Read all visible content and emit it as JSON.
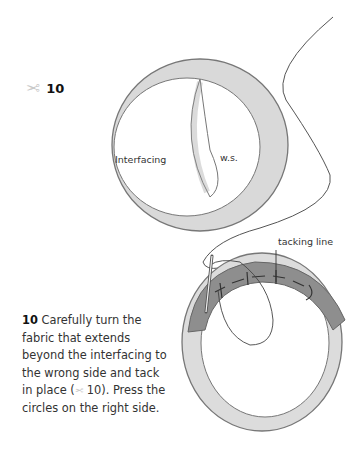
{
  "figure": {
    "number": "10",
    "icon": "scissors-icon",
    "labels": {
      "interfacing": "Interfacing",
      "wrong_side": "w.s.",
      "tacking_line": "tacking line"
    }
  },
  "caption": {
    "step_number": "10",
    "text_before_ref": "Carefully turn the fabric that extends beyond the interfacing to the wrong side and tack in place (",
    "ref_number": " 10).",
    "text_after_ref": " Press the circles on the right side."
  },
  "colors": {
    "ring_light": "#d9d9d9",
    "ring_dark": "#8a8a8a",
    "outline": "#6e6e6e",
    "icon": "#c9c9c9"
  }
}
